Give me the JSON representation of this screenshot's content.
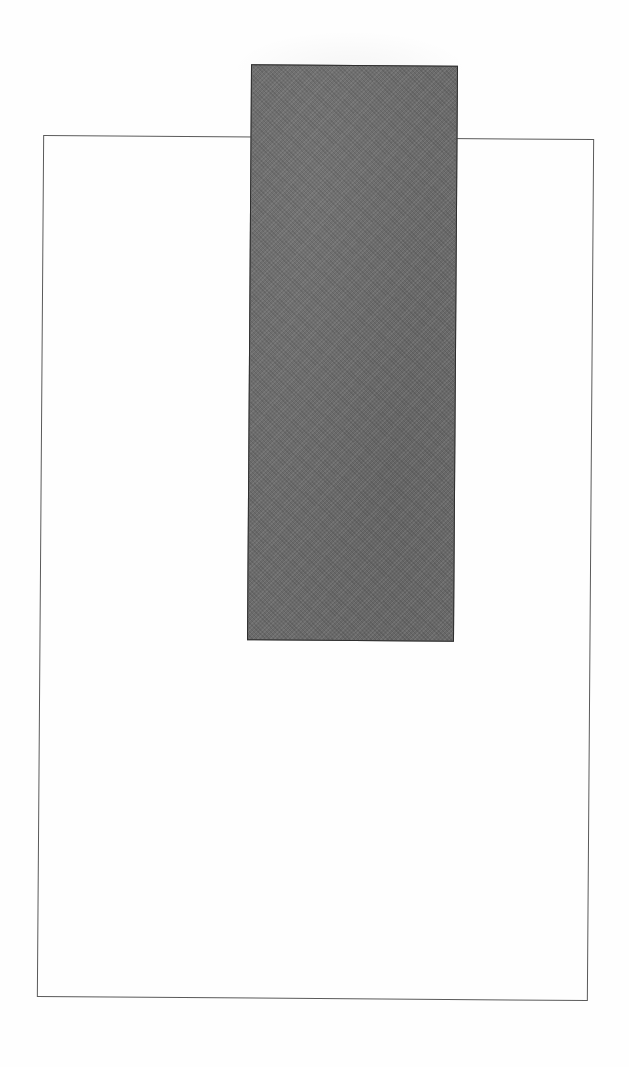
{
  "document": {
    "type": "scanned-page",
    "background_color": "#fefefe",
    "frame": {
      "stroke_color": "#5a5a5a",
      "corners": {
        "top_left": [
          43,
          135
        ],
        "top_right": [
          594,
          139
        ],
        "bottom_left": [
          37,
          997
        ],
        "bottom_right": [
          587,
          1002
        ]
      }
    },
    "filled_block": {
      "fill_color": "#6b6b6b",
      "pattern": "halftone",
      "border_color": "#2e2e2e",
      "corners": {
        "top_left": [
          251,
          65
        ],
        "top_right": [
          458,
          66
        ],
        "bottom_left": [
          247,
          640
        ],
        "bottom_right": [
          454,
          641
        ]
      }
    },
    "text": []
  }
}
